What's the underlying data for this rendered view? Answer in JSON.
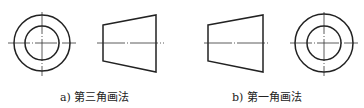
{
  "figure": {
    "panels": [
      {
        "id": "a",
        "caption": "a) 第三角画法",
        "layout": "end view (circle) on left, front view (trapezoid) on right"
      },
      {
        "id": "b",
        "caption": "b) 第一角画法",
        "layout": "front view (trapezoid) on left, end view (circle) on right"
      }
    ],
    "colors": {
      "line": "#222222",
      "background": "#ffffff"
    }
  }
}
